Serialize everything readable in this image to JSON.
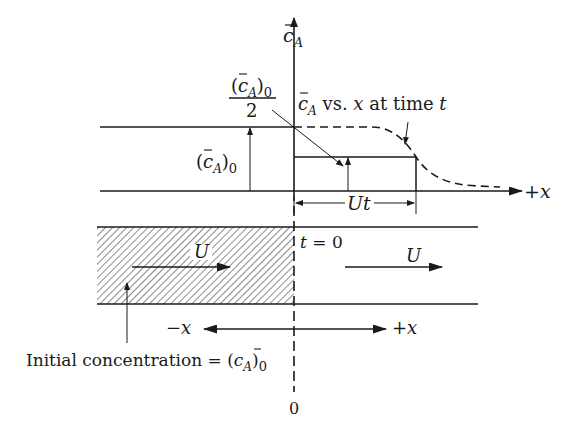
{
  "diagram": {
    "axis": {
      "y_label_base": "c",
      "y_label_sub": "A",
      "x_label": "+x"
    },
    "labels": {
      "half_conc_num_base": "(c",
      "half_conc_num_sub": "A",
      "half_conc_num_close": ")",
      "half_conc_num_sub0": "0",
      "half_conc_den": "2",
      "curve_label_base": "c",
      "curve_label_sub": "A",
      "curve_label_text": " vs. ",
      "curve_label_x": "x",
      "curve_label_at": " at time ",
      "curve_label_t": "t",
      "init_conc_base": "(c",
      "init_conc_sub": "A",
      "init_conc_close": ")",
      "init_conc_sub0": "0",
      "ut": "Ut",
      "t_zero_t": "t",
      "t_zero_rest": " = 0",
      "velocity_left": "U",
      "velocity_right": "U",
      "minus_x": "−x",
      "plus_x": "+x",
      "initial_concentration_text": "Initial  concentration = (c",
      "initial_concentration_sub": "A",
      "initial_concentration_close": ")",
      "initial_concentration_sub0": "0",
      "origin": "0"
    },
    "colors": {
      "ink": "#1a1a1a",
      "background": "#ffffff"
    }
  }
}
